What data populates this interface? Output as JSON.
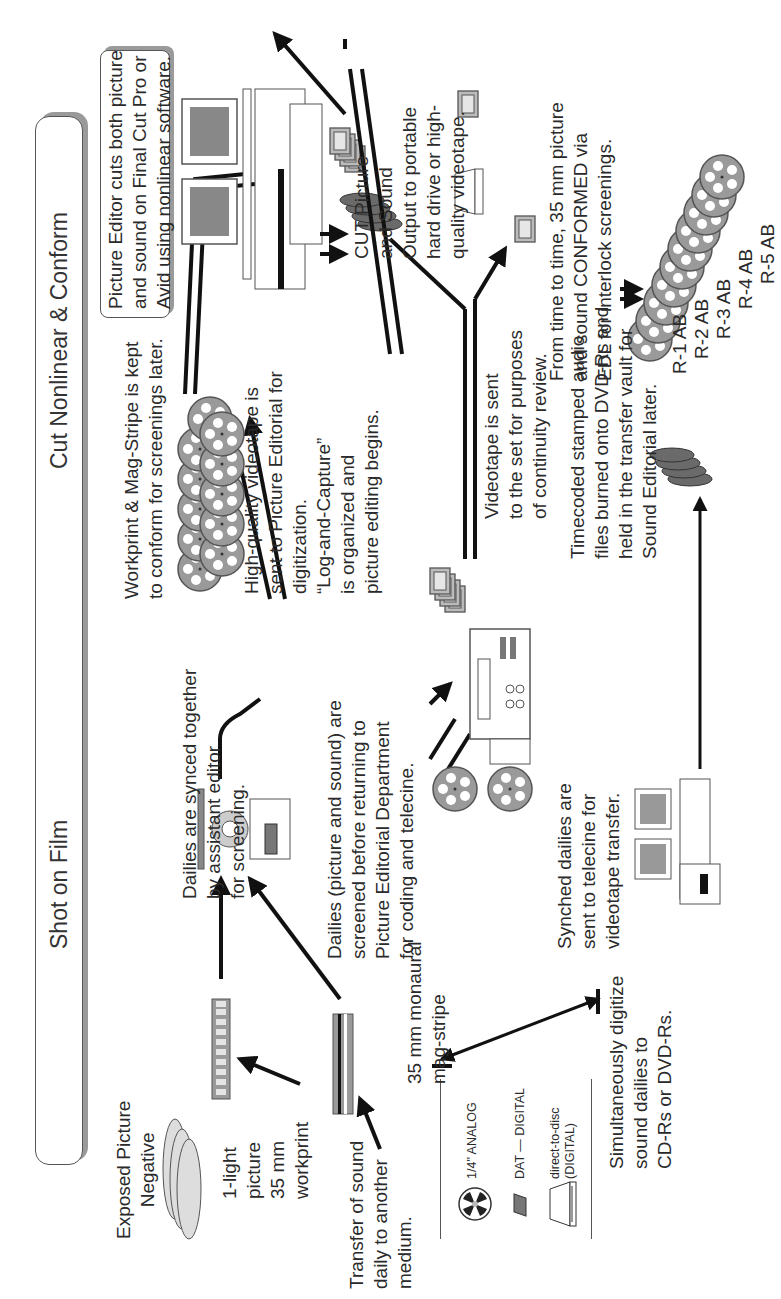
{
  "diagram": {
    "type": "workflow",
    "orientation": "rotated-90-ccw",
    "sections": [
      {
        "id": "shot",
        "label": "Shot on Film"
      },
      {
        "id": "cut",
        "label": "Cut Nonlinear & Conform"
      }
    ],
    "nodes": {
      "exposed_negative": "Exposed Picture\nNegative",
      "workprint": "1-light\npicture\n35 mm\nworkprint",
      "sound_transfer": "Transfer of sound\ndaily to another\nmedium.",
      "magstripe": "35 mm monaural\nmag-stripe",
      "synced": "Dailies are synced together\nby assistant editor\nfor screening.",
      "screened": "Dailies (picture and sound) are\nscreened before returning to\nPicture Editorial Department\nfor coding and telecine.",
      "telecine": "Synched dailies are\nsent to telecine for\nvideotape transfer.",
      "digitize": "Simultaneously digitize\nsound dailies to\nCD-Rs or DVD-Rs.",
      "timecoded": "Timecoded stamped audio\nfiles burned onto DVD-Rs and\nheld in the transfer vault for\nSound Editorial later.",
      "videotape_set": "Videotape is sent\nto the set for purposes\nof continuity review.",
      "hq_videotape": "High-quality videotape is\nsent to Picture Editorial for\ndigitization.\n“Log-and-Capture”\nis organized and\npicture editing begins.",
      "workprint_kept": "Workprint & Mag-Stripe is kept\nto conform for screenings later.",
      "picture_editor": "Picture Editor cuts both picture\nand sound on Final Cut Pro or\nAvid using nonlinear software.",
      "cut_output": "CUT Picture\nand Sound\nOutput to portable\nhard drive or high-\nquality videotape.",
      "conformed": "From time to time, 35 mm picture\nand sound CONFORMED via\nEDL for interlock screenings."
    },
    "legend": [
      {
        "icon": "reel-icon",
        "label": "1/4\" ANALOG"
      },
      {
        "icon": "dat-tape-icon",
        "label": "DAT — DIGITAL"
      },
      {
        "icon": "disc-drive-icon",
        "label": "direct-to-disc\n(DIGITAL)"
      }
    ],
    "reels": [
      "R-1 AB",
      "R-2 AB",
      "R-3 AB",
      "R-4 AB",
      "R-5 AB"
    ],
    "colors": {
      "line": "#111111",
      "box_border": "#555555",
      "shadow": "#9a9a9a",
      "fill_gray": "#8c8c8c",
      "fill_light": "#d8d8d8"
    }
  }
}
